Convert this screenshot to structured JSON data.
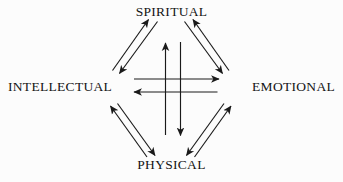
{
  "diagram": {
    "type": "cycle-diagram",
    "background_color": "#fcfcfc",
    "stroke_color": "#1a1a1a",
    "nodes": [
      {
        "id": "spiritual",
        "label": "SPIRITUAL",
        "position": "top"
      },
      {
        "id": "intellectual",
        "label": "INTELLECTUAL",
        "position": "left"
      },
      {
        "id": "emotional",
        "label": "EMOTIONAL",
        "position": "right"
      },
      {
        "id": "physical",
        "label": "PHYSICAL",
        "position": "bottom"
      }
    ],
    "edges": [
      {
        "from": "intellectual",
        "to": "spiritual",
        "style": "perimeter"
      },
      {
        "from": "spiritual",
        "to": "intellectual",
        "style": "perimeter"
      },
      {
        "from": "emotional",
        "to": "spiritual",
        "style": "perimeter"
      },
      {
        "from": "spiritual",
        "to": "emotional",
        "style": "perimeter"
      },
      {
        "from": "intellectual",
        "to": "physical",
        "style": "perimeter"
      },
      {
        "from": "physical",
        "to": "intellectual",
        "style": "perimeter"
      },
      {
        "from": "emotional",
        "to": "physical",
        "style": "perimeter"
      },
      {
        "from": "physical",
        "to": "emotional",
        "style": "perimeter"
      },
      {
        "from": "intellectual",
        "to": "emotional",
        "style": "cross"
      },
      {
        "from": "emotional",
        "to": "intellectual",
        "style": "cross"
      },
      {
        "from": "physical",
        "to": "spiritual",
        "style": "cross"
      },
      {
        "from": "spiritual",
        "to": "physical",
        "style": "cross"
      }
    ]
  }
}
